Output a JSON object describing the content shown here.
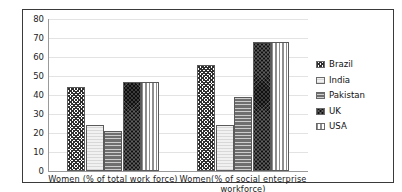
{
  "chart_data": {
    "type": "bar",
    "title": "",
    "xlabel": "",
    "ylabel": "",
    "ylim": [
      0,
      80
    ],
    "yticks": [
      80,
      70,
      60,
      50,
      40,
      30,
      20,
      10,
      0
    ],
    "grid": true,
    "legend_position": "right",
    "categories": [
      "Women (% of total work force)",
      "Women(% of social enterprise workforce)"
    ],
    "series": [
      {
        "name": "Brazil",
        "values": [
          44,
          56
        ],
        "pattern": "diagonal-crosshatch",
        "color": "#2e2e2e"
      },
      {
        "name": "India",
        "values": [
          24,
          24
        ],
        "pattern": "light-dotted",
        "color": "#f1f1f1"
      },
      {
        "name": "Pakistan",
        "values": [
          21,
          39
        ],
        "pattern": "horizontal-lines",
        "color": "#6f6f6f"
      },
      {
        "name": "UK",
        "values": [
          47,
          68
        ],
        "pattern": "dark-crosshatch",
        "color": "#101010"
      },
      {
        "name": "USA",
        "values": [
          47,
          68
        ],
        "pattern": "vertical-lines",
        "color": "#8e8e8e"
      }
    ]
  },
  "legend": {
    "items": [
      {
        "label": "Brazil"
      },
      {
        "label": "India"
      },
      {
        "label": "Pakistan"
      },
      {
        "label": "UK"
      },
      {
        "label": "USA"
      }
    ]
  },
  "axis": {
    "y_tick_labels": [
      "80",
      "70",
      "60",
      "50",
      "40",
      "30",
      "20",
      "10",
      "0"
    ],
    "x_tick_labels": [
      "Women (% of total work force)",
      "Women(% of social enterprise workforce)"
    ]
  }
}
